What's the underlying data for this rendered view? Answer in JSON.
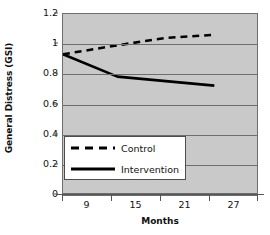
{
  "chart_data": {
    "type": "line",
    "title": "",
    "xlabel": "Months",
    "ylabel": "General Distress (GSI)",
    "x": [
      9,
      15,
      21,
      27
    ],
    "xticklabels": [
      "9",
      "15",
      "21",
      "27"
    ],
    "yticklabels": [
      "0",
      "0.2",
      "0.4",
      "0.6",
      "0.8",
      "1",
      "1.2"
    ],
    "ytickvalues": [
      0,
      0.2,
      0.4,
      0.6,
      0.8,
      1,
      1.2
    ],
    "ylim": [
      0,
      1.2
    ],
    "grid": true,
    "legend_position": "lower left inside plot",
    "plot_background": "#c9c9c9",
    "series": [
      {
        "name": "Control",
        "style": "dashed",
        "color": "#000000",
        "values": [
          0.93,
          0.99,
          1.04,
          1.06
        ]
      },
      {
        "name": "Intervention",
        "style": "solid",
        "color": "#000000",
        "values": [
          0.93,
          0.78,
          0.75,
          0.72
        ]
      }
    ],
    "legend": [
      {
        "label": "Control",
        "style": "dashed"
      },
      {
        "label": "Intervention",
        "style": "solid"
      }
    ]
  },
  "axes": {
    "y_title": "General Distress (GSI)",
    "x_title": "Months",
    "y_ticks": [
      "1.2",
      "1",
      "0.8",
      "0.6",
      "0.4",
      "0.2",
      "0"
    ],
    "x_ticks": [
      "9",
      "15",
      "21",
      "27"
    ]
  },
  "legend": {
    "control_label": "Control",
    "intervention_label": "Intervention"
  }
}
